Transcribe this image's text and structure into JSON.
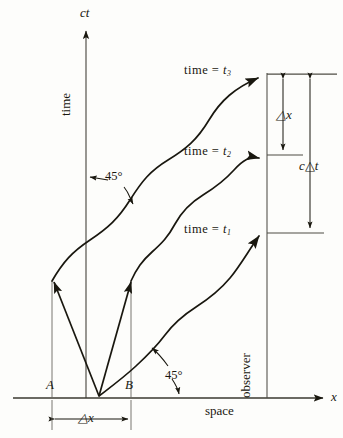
{
  "figure": {
    "background_color": "#fdfdfb",
    "ink_color": "#19170f",
    "thin_ink_color": "#5a584f"
  },
  "axes": {
    "vertical_axis_label": "ct",
    "vertical_axis_name_label": "time",
    "horizontal_axis_label": "x",
    "horizontal_axis_name_label": "space"
  },
  "event_markers": {
    "left_event_label": "A",
    "right_event_label": "B",
    "separation_label": "△x"
  },
  "worldline": {
    "observer_label": "observer"
  },
  "angle_annotations": [
    {
      "label": "45°",
      "id": "upper-left-45"
    },
    {
      "label": "45°",
      "id": "lower-right-45"
    }
  ],
  "reception_events": [
    {
      "label_prefix": "time",
      "equals": "=",
      "symbol": "t",
      "subscript": "3"
    },
    {
      "label_prefix": "time",
      "equals": "=",
      "symbol": "t",
      "subscript": "2"
    },
    {
      "label_prefix": "time",
      "equals": "=",
      "symbol": "t",
      "subscript": "1"
    }
  ],
  "measurements": {
    "delta_x_label": "△x",
    "c_delta_t_label_prefix": "c",
    "c_delta_t_label_delta": "△",
    "c_delta_t_label_suffix": "t",
    "bottom_delta_x_label": "△x"
  }
}
